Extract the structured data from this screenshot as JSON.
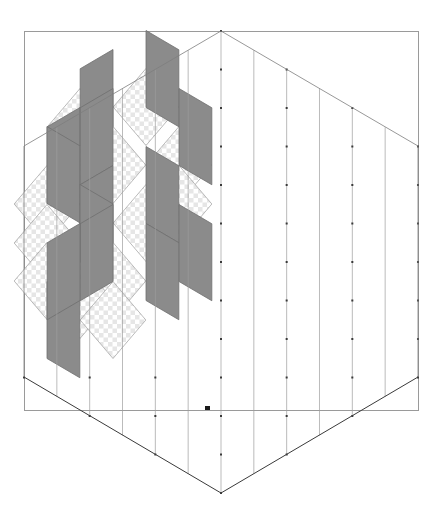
{
  "document": {
    "title": "Isometric rhombille tessellation diagram",
    "background_color": "#ffffff"
  },
  "frame": {
    "name": "plot-border",
    "x": 24,
    "y": 31,
    "width": 394,
    "height": 379,
    "stroke": "#9a9a9a",
    "stroke_width": 1
  },
  "palette": {
    "line_light": "#9d9d9d",
    "line_mid": "#7d7d7d",
    "line_dark": "#3a3a3a",
    "fill_dark": "#8b8b8b",
    "fill_dark_stroke": "#6f6f6f",
    "checker_light": "#ffffff",
    "checker_dark": "#e6e6e6",
    "marker": "#1a1a1a",
    "white": "#ffffff"
  },
  "geometry": {
    "hexagon": {
      "name": "outer-hexagon",
      "center_x": 221,
      "center_y": 262,
      "top_apex": [
        221,
        31
      ],
      "bottom_apex": [
        221,
        493
      ],
      "left_upper": [
        24,
        146
      ],
      "left_lower": [
        24,
        377
      ],
      "right_upper": [
        418,
        146
      ],
      "right_lower": [
        418,
        377
      ],
      "radius_x": 197,
      "radius_y": 231
    },
    "lattice": {
      "type": "isometric-triangular",
      "cells_per_side": 6,
      "step_x": 32.83,
      "step_y": 19.25,
      "column_height": 38.5
    }
  },
  "marker": {
    "name": "cursor-marker",
    "x": 205,
    "y": 406,
    "width": 5,
    "height": 4,
    "color": "#1a1a1a"
  },
  "shaded_cells": {
    "description": "Rhombi of the upper-left region rendered with fills",
    "dark_count": 14,
    "checker_count": 13,
    "dark_rhombi": [
      {
        "id": "d1",
        "cx": 113,
        "cy": 88,
        "orient": "left"
      },
      {
        "id": "d2",
        "cx": 146,
        "cy": 69,
        "orient": "right"
      },
      {
        "id": "d3",
        "cx": 80,
        "cy": 146,
        "orient": "left"
      },
      {
        "id": "d4",
        "cx": 113,
        "cy": 127,
        "orient": "left"
      },
      {
        "id": "d5",
        "cx": 47,
        "cy": 165,
        "orient": "right"
      },
      {
        "id": "d6",
        "cx": 179,
        "cy": 127,
        "orient": "right"
      },
      {
        "id": "d7",
        "cx": 113,
        "cy": 204,
        "orient": "left"
      },
      {
        "id": "d8",
        "cx": 146,
        "cy": 185,
        "orient": "right"
      },
      {
        "id": "d9",
        "cx": 80,
        "cy": 223,
        "orient": "right"
      },
      {
        "id": "d10",
        "cx": 113,
        "cy": 243,
        "orient": "left"
      },
      {
        "id": "d11",
        "cx": 146,
        "cy": 262,
        "orient": "right"
      },
      {
        "id": "d12",
        "cx": 179,
        "cy": 243,
        "orient": "right"
      },
      {
        "id": "d13",
        "cx": 47,
        "cy": 320,
        "orient": "right"
      },
      {
        "id": "d14",
        "cx": 80,
        "cy": 262,
        "orient": "left"
      }
    ],
    "checker_rhombi": [
      {
        "id": "c1",
        "cx": 146,
        "cy": 107,
        "orient": "top"
      },
      {
        "id": "c2",
        "cx": 179,
        "cy": 165,
        "orient": "top"
      },
      {
        "id": "c3",
        "cx": 113,
        "cy": 165,
        "orient": "top"
      },
      {
        "id": "c4",
        "cx": 80,
        "cy": 185,
        "orient": "top"
      },
      {
        "id": "c5",
        "cx": 47,
        "cy": 204,
        "orient": "top"
      },
      {
        "id": "c6",
        "cx": 47,
        "cy": 243,
        "orient": "top"
      },
      {
        "id": "c7",
        "cx": 113,
        "cy": 281,
        "orient": "top"
      },
      {
        "id": "c8",
        "cx": 146,
        "cy": 223,
        "orient": "top"
      },
      {
        "id": "c9",
        "cx": 80,
        "cy": 300,
        "orient": "top"
      },
      {
        "id": "c10",
        "cx": 47,
        "cy": 281,
        "orient": "top"
      },
      {
        "id": "c11",
        "cx": 179,
        "cy": 204,
        "orient": "top"
      },
      {
        "id": "c12",
        "cx": 113,
        "cy": 320,
        "orient": "top"
      },
      {
        "id": "c13",
        "cx": 80,
        "cy": 127,
        "orient": "top"
      }
    ]
  },
  "labels": {
    "figure_caption": "",
    "axis_labels": [],
    "legend": []
  }
}
